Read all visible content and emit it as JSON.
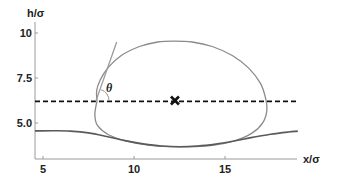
{
  "chart_data": {
    "type": "line",
    "title": "",
    "xlabel": "x/σ",
    "ylabel": "h/σ",
    "xlim": [
      4.56,
      19.0
    ],
    "ylim": [
      3.0,
      10.4
    ],
    "grid": false,
    "legend": null,
    "x_ticks": [
      5,
      10,
      15
    ],
    "x_tick_labels": [
      "5",
      "10",
      "15"
    ],
    "y_ticks": [
      5.0,
      7.5,
      10
    ],
    "y_tick_labels": [
      "5.0",
      "7.5",
      "10"
    ],
    "series": [
      {
        "name": "droplet-contour",
        "style": "solid",
        "color": "#8a8a8a",
        "closed": true,
        "points": [
          [
            7.97,
            6.2
          ],
          [
            7.95,
            6.8
          ],
          [
            8.15,
            7.4
          ],
          [
            8.6,
            8.1
          ],
          [
            9.3,
            8.75
          ],
          [
            10.3,
            9.25
          ],
          [
            11.3,
            9.5
          ],
          [
            12.2,
            9.55
          ],
          [
            13.2,
            9.5
          ],
          [
            14.3,
            9.25
          ],
          [
            15.4,
            8.75
          ],
          [
            16.3,
            8.05
          ],
          [
            16.95,
            7.2
          ],
          [
            17.25,
            6.3
          ],
          [
            17.3,
            5.7
          ],
          [
            17.1,
            5.05
          ],
          [
            16.5,
            4.45
          ],
          [
            15.5,
            4.0
          ],
          [
            14.2,
            3.75
          ],
          [
            12.5,
            3.68
          ],
          [
            10.8,
            3.77
          ],
          [
            9.6,
            4.0
          ],
          [
            8.6,
            4.35
          ],
          [
            8.0,
            4.85
          ],
          [
            7.85,
            5.4
          ],
          [
            7.9,
            5.9
          ],
          [
            7.97,
            6.2
          ]
        ]
      },
      {
        "name": "substrate-interface",
        "style": "solid",
        "color": "#5a5a5a",
        "points": [
          [
            4.56,
            4.56
          ],
          [
            5.5,
            4.57
          ],
          [
            6.5,
            4.55
          ],
          [
            7.5,
            4.45
          ],
          [
            8.5,
            4.25
          ],
          [
            9.5,
            4.02
          ],
          [
            10.5,
            3.84
          ],
          [
            11.5,
            3.72
          ],
          [
            12.5,
            3.68
          ],
          [
            13.5,
            3.72
          ],
          [
            14.5,
            3.83
          ],
          [
            15.5,
            4.0
          ],
          [
            16.5,
            4.2
          ],
          [
            17.5,
            4.38
          ],
          [
            18.5,
            4.5
          ],
          [
            19.0,
            4.55
          ]
        ]
      },
      {
        "name": "contact-line-level",
        "style": "dashed",
        "color": "#111111",
        "points": [
          [
            4.56,
            6.2
          ],
          [
            19.0,
            6.2
          ]
        ]
      },
      {
        "name": "tangent-line",
        "style": "solid",
        "color": "#9a9a9a",
        "points": [
          [
            7.9,
            6.2
          ],
          [
            9.05,
            9.5
          ]
        ]
      }
    ],
    "markers": [
      {
        "name": "center-of-mass",
        "symbol": "x",
        "x": 12.25,
        "y": 6.25,
        "color": "#111111"
      }
    ],
    "annotations": [
      {
        "text": "θ",
        "x": 8.55,
        "y": 7.0,
        "meaning": "contact angle between tangent and dashed line"
      }
    ]
  },
  "labels": {
    "x_axis": "x/σ",
    "y_axis": "h/σ",
    "theta": "θ",
    "x_ticks": [
      "5",
      "10",
      "15"
    ],
    "y_ticks": [
      "10",
      "7.5",
      "5.0"
    ]
  }
}
